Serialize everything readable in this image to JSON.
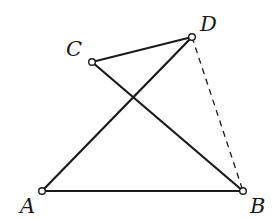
{
  "diagram": {
    "type": "geometry",
    "points": {
      "A": {
        "label": "A",
        "x": 42,
        "y": 191
      },
      "B": {
        "label": "B",
        "x": 243,
        "y": 191
      },
      "C": {
        "label": "C",
        "x": 92,
        "y": 62
      },
      "D": {
        "label": "D",
        "x": 192,
        "y": 37
      }
    },
    "segments": [
      {
        "from": "A",
        "to": "B",
        "style": "solid"
      },
      {
        "from": "A",
        "to": "D",
        "style": "solid"
      },
      {
        "from": "C",
        "to": "D",
        "style": "solid"
      },
      {
        "from": "C",
        "to": "B",
        "style": "solid"
      },
      {
        "from": "D",
        "to": "B",
        "style": "dashed"
      }
    ],
    "colors": {
      "stroke": "#1a1a1a",
      "background": "#ffffff"
    }
  }
}
